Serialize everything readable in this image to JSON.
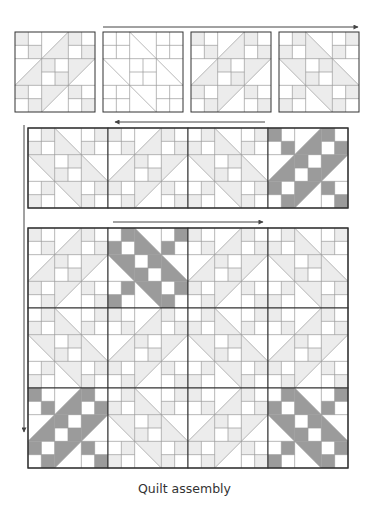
{
  "caption": "Quilt assembly",
  "colors": {
    "outline": "#333333",
    "gridline": "#9a9a9a",
    "light_fill": "#ececec",
    "dark_fill": "#9b9b9b",
    "background": "#ffffff",
    "arrow": "#444444"
  },
  "steps": [
    {
      "name": "row-1-separate-blocks",
      "arrow_direction": "right",
      "blocks": [
        {
          "orientation": "slash",
          "shade": "light"
        },
        {
          "orientation": "backslash",
          "shade": "none"
        },
        {
          "orientation": "slash",
          "shade": "light"
        },
        {
          "orientation": "backslash",
          "shade": "light"
        }
      ]
    },
    {
      "name": "row-2-joined-strip",
      "arrow_direction": "left",
      "blocks": [
        {
          "orientation": "backslash",
          "shade": "light"
        },
        {
          "orientation": "slash",
          "shade": "light"
        },
        {
          "orientation": "backslash",
          "shade": "light"
        },
        {
          "orientation": "slash",
          "shade": "dark"
        }
      ]
    },
    {
      "name": "quilt-top-assembled",
      "arrow_direction": "right",
      "rows": [
        [
          {
            "orientation": "slash",
            "shade": "light"
          },
          {
            "orientation": "backslash",
            "shade": "dark"
          },
          {
            "orientation": "slash",
            "shade": "light"
          },
          {
            "orientation": "backslash",
            "shade": "light"
          }
        ],
        [
          {
            "orientation": "backslash",
            "shade": "light"
          },
          {
            "orientation": "slash",
            "shade": "light"
          },
          {
            "orientation": "backslash",
            "shade": "light"
          },
          {
            "orientation": "slash",
            "shade": "light"
          }
        ],
        [
          {
            "orientation": "slash",
            "shade": "dark"
          },
          {
            "orientation": "backslash",
            "shade": "light"
          },
          {
            "orientation": "slash",
            "shade": "light"
          },
          {
            "orientation": "backslash",
            "shade": "dark"
          }
        ]
      ]
    }
  ],
  "vertical_arrow_direction": "down"
}
